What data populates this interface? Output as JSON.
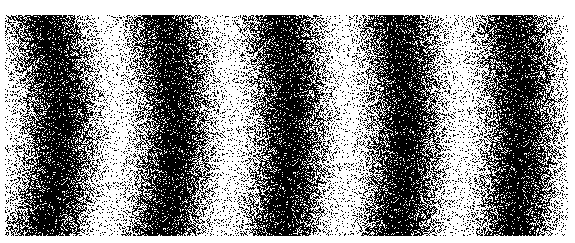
{
  "image": {
    "description": "Binary dithered interference fringe pattern: curved dark and light bands with heavy speckle noise",
    "width": 563,
    "height": 221,
    "offset": {
      "x": 5,
      "y": 15
    },
    "colors": {
      "ink": "#000000",
      "paper": "#ffffff",
      "background": "#ffffff"
    },
    "fringes": {
      "dark_band_centers_top_x": [
        15,
        150,
        270,
        385,
        490
      ],
      "dark_band_centers_middle_x": [
        60,
        180,
        295,
        405,
        510
      ],
      "dark_band_centers_bottom_x": [
        15,
        145,
        270,
        385,
        500
      ],
      "curvature": "arcs bulging to the right (center of curvature to the left)",
      "period_px": 115
    }
  }
}
